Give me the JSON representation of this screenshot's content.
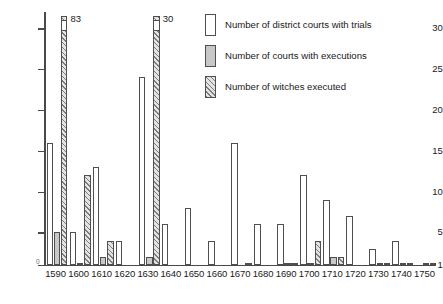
{
  "chart_data": {
    "type": "bar",
    "title": "",
    "xlabel": "",
    "ylabel": "",
    "ylim": [
      1,
      32
    ],
    "yticks": [
      1,
      5,
      10,
      15,
      20,
      25,
      30
    ],
    "grid": false,
    "origin_label": "0",
    "legend_position": "top-right",
    "categories": [
      "1590",
      "1600",
      "1610",
      "1620",
      "1630",
      "1640",
      "1650",
      "1660",
      "1670",
      "1680",
      "1690",
      "1700",
      "1710",
      "1720",
      "1730",
      "1740",
      "1750"
    ],
    "series": [
      {
        "name": "Number of district courts with trials",
        "style": "white",
        "values": [
          16,
          5,
          13,
          4,
          24,
          6,
          8,
          4,
          16,
          6,
          6,
          12,
          9,
          7,
          3,
          4,
          0
        ]
      },
      {
        "name": "Number of courts with executions",
        "style": "gray",
        "values": [
          5,
          1,
          2,
          0,
          2,
          0,
          0,
          0,
          0,
          0,
          1,
          1,
          2,
          0,
          1,
          1,
          1
        ]
      },
      {
        "name": "Number of witches executed",
        "style": "hatched",
        "values": [
          83,
          12,
          4,
          0,
          30,
          0,
          0,
          0,
          1,
          0,
          1,
          4,
          2,
          0,
          1,
          1,
          1
        ]
      }
    ],
    "clipped_bars": [
      {
        "category": "1590",
        "series": "Number of witches executed",
        "label": "83"
      },
      {
        "category": "1630",
        "series": "Number of witches executed",
        "label": "30"
      }
    ]
  },
  "legend": {
    "items": [
      {
        "label": "Number of district courts with trials",
        "style": "trials"
      },
      {
        "label": "Number of courts with executions",
        "style": "executions"
      },
      {
        "label": "Number of witches executed",
        "style": "witches"
      }
    ]
  }
}
